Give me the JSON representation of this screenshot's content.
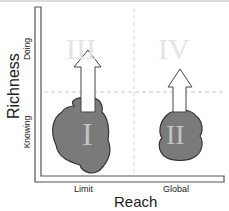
{
  "diagram": {
    "type": "quadrant-diagram",
    "axes": {
      "x_label": "Reach",
      "y_label": "Richness",
      "x_ticks": [
        "Limit",
        "Global"
      ],
      "y_ticks": [
        "Knowing",
        "Doing"
      ]
    },
    "quadrants": {
      "q1": "I",
      "q2": "II",
      "q3": "III",
      "q4": "IV"
    },
    "colors": {
      "blob_fill": "#7a7a7a",
      "blob_stroke": "#333333",
      "arrow_fill": "#ffffff",
      "arrow_stroke": "#444444",
      "roman_light": "#e6e6e6",
      "roman_on_blob": "#bdbdbd",
      "dashed_line": "#c8c8c8",
      "axis": "#555555"
    },
    "arrows": [
      {
        "from": "I",
        "to": "III"
      },
      {
        "from": "II",
        "to": "IV"
      }
    ]
  }
}
